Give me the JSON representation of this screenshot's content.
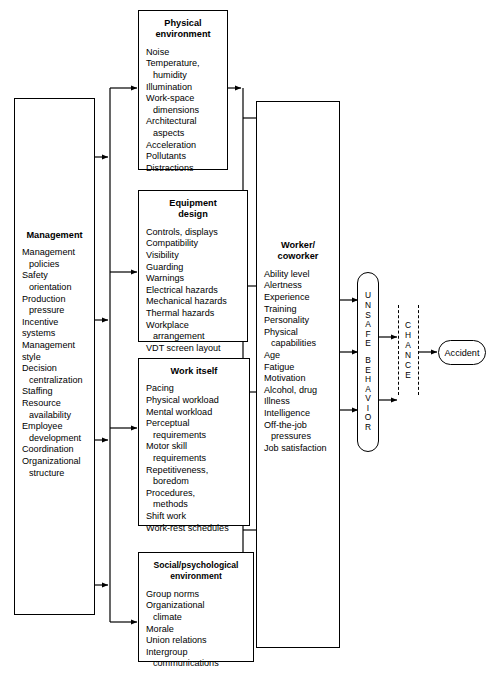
{
  "diagram": {
    "type": "flow-diagram",
    "stroke_color": "#000000",
    "background": "#ffffff"
  },
  "management": {
    "title": "Management",
    "items": [
      "Management\npolicies",
      "Safety\norientation",
      "Production\npressure",
      "Incentive systems",
      "Management style",
      "Decision\ncentralization",
      "Staffing",
      "Resource\navailability",
      "Employee\ndevelopment",
      "Coordination",
      "Organizational\nstructure"
    ]
  },
  "physical_environment": {
    "title": "Physical\nenvironment",
    "items": [
      "Noise",
      "Temperature,\nhumidity",
      "Illumination",
      "Work-space\ndimensions",
      "Architectural\naspects",
      "Acceleration",
      "Pollutants",
      "Distractions"
    ]
  },
  "equipment_design": {
    "title": "Equipment\ndesign",
    "items": [
      "Controls, displays",
      "Compatibility",
      "Visibility",
      "Guarding",
      "Warnings",
      "Electrical hazards",
      "Mechanical hazards",
      "Thermal hazards",
      "Workplace\narrangement",
      "VDT screen layout"
    ]
  },
  "work_itself": {
    "title": "Work itself",
    "items": [
      "Pacing",
      "Physical workload",
      "Mental workload",
      "Perceptual\nrequirements",
      "Motor skill\nrequirements",
      "Repetitiveness,\nboredom",
      "Procedures,\nmethods",
      "Shift work",
      "Work-rest schedules"
    ]
  },
  "social_environment": {
    "title": "Social/psychological\nenvironment",
    "items": [
      "Group norms",
      "Organizational\nclimate",
      "Morale",
      "Union relations",
      "Intergroup\ncommunications"
    ]
  },
  "worker": {
    "title": "Worker/\ncoworker",
    "items": [
      "Ability level",
      "Alertness",
      "Experience",
      "Training",
      "Personality",
      "Physical\ncapabilities",
      "Age",
      "Fatigue",
      "Motivation",
      "Alcohol, drug",
      "Illness",
      "Intelligence",
      "Off-the-job\npressures",
      "Job satisfaction"
    ]
  },
  "unsafe_behavior": {
    "label_top": "UNSAFE",
    "label_bottom": "BEHAVIOR",
    "letters_top": [
      "U",
      "N",
      "S",
      "A",
      "F",
      "E"
    ],
    "letters_bottom": [
      "B",
      "E",
      "H",
      "A",
      "V",
      "I",
      "O",
      "R"
    ]
  },
  "chance": {
    "label": "CHANCE",
    "letters": [
      "C",
      "H",
      "A",
      "N",
      "C",
      "E"
    ]
  },
  "accident": {
    "label": "Accident"
  }
}
